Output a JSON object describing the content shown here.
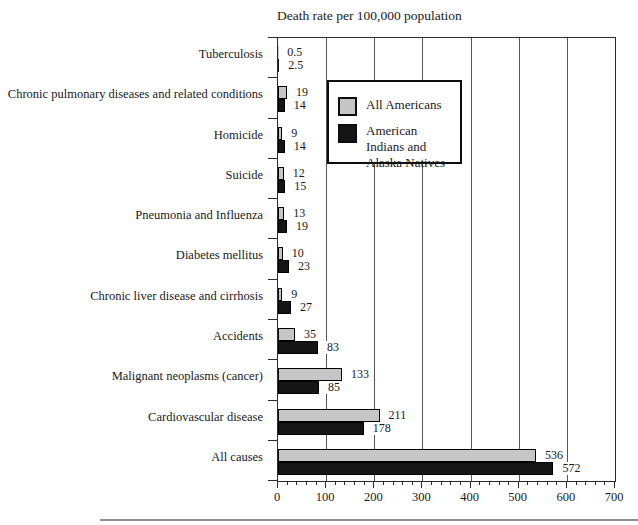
{
  "page": {
    "background": "#ffffff"
  },
  "title": "Death rate per 100,000 population",
  "chart_data": {
    "type": "bar",
    "orientation": "horizontal",
    "title": "Death rate per 100,000 population",
    "categories": [
      "Tuberculosis",
      "Chronic pulmonary diseases and related conditions",
      "Homicide",
      "Suicide",
      "Pneumonia and Influenza",
      "Diabetes mellitus",
      "Chronic liver disease and cirrhosis",
      "Accidents",
      "Malignant neoplasms (cancer)",
      "Cardiovascular disease",
      "All causes"
    ],
    "series": [
      {
        "name": "All Americans",
        "color": "#c6c6c6",
        "values": [
          0.5,
          19,
          9,
          12,
          13,
          10,
          9,
          35,
          133,
          211,
          536
        ]
      },
      {
        "name": "American Indians and Alaska Natives",
        "color": "#151515",
        "values": [
          2.5,
          14,
          14,
          15,
          19,
          23,
          27,
          83,
          85,
          178,
          572
        ]
      }
    ],
    "xlim": [
      0,
      700
    ],
    "x_ticks": [
      0,
      100,
      200,
      300,
      400,
      500,
      600,
      700
    ],
    "minor_tick_step": 20,
    "grid": "vertical-major",
    "value_labels_shown": true,
    "legend_position": "inside-top-left"
  },
  "legend": {
    "entries": [
      {
        "label": "All Americans",
        "swatch_color": "#c6c6c6"
      },
      {
        "label": "American Indians and Alaska Natives",
        "swatch_color": "#151515"
      }
    ]
  },
  "colors": {
    "frame": "#2b2b2b",
    "gridline": "#555555",
    "text": "#1a1a1a",
    "bottom_rule": "#8f8f8f"
  }
}
